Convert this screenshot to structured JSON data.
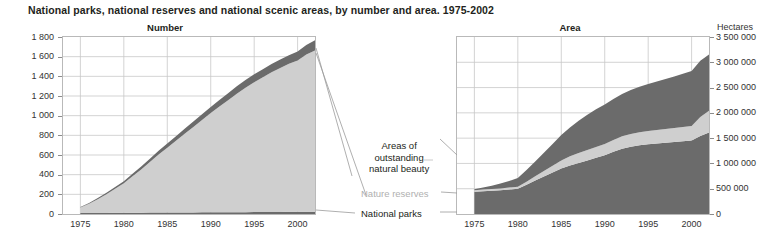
{
  "title": "National parks, national reserves and national scenic areas, by number and area. 1975-2002",
  "colors": {
    "dark_band": "#6b6b6b",
    "light_band": "#cfcfcf",
    "grid": "#c8c8c8",
    "frame": "#b9b9b9",
    "text": "#231f20",
    "muted_text": "#b0b0b0"
  },
  "annotations": {
    "outstanding": "Areas of\noutstanding\nnatural beauty",
    "nature_reserves": "Nature reserves",
    "national_parks": "National parks"
  },
  "chart_data": [
    {
      "type": "area",
      "id": "number",
      "title": "Number",
      "stacked": true,
      "xlabel": "",
      "ylabel": "",
      "unit": "",
      "xlim": [
        1973,
        2002
      ],
      "ylim": [
        0,
        1800
      ],
      "grid": true,
      "legend_position": "callout-right",
      "x": [
        1975,
        1976,
        1977,
        1978,
        1979,
        1980,
        1981,
        1982,
        1983,
        1984,
        1985,
        1986,
        1987,
        1988,
        1989,
        1990,
        1991,
        1992,
        1993,
        1994,
        1995,
        1996,
        1997,
        1998,
        1999,
        2000,
        2001,
        2002
      ],
      "xticks": [
        1975,
        1980,
        1985,
        1990,
        1995,
        2000
      ],
      "yticks": [
        0,
        200,
        400,
        600,
        800,
        1000,
        1200,
        1400,
        1600,
        1800
      ],
      "ytick_labels": [
        "0",
        "200",
        "400",
        "600",
        "800",
        "1 000",
        "1 200",
        "1 400",
        "1 600",
        "1 800"
      ],
      "series": [
        {
          "name": "National parks",
          "color": "#6b6b6b",
          "values": [
            10,
            10,
            11,
            11,
            12,
            12,
            13,
            13,
            14,
            14,
            15,
            15,
            16,
            16,
            17,
            17,
            18,
            18,
            19,
            19,
            20,
            20,
            21,
            21,
            22,
            22,
            23,
            23
          ]
        },
        {
          "name": "Nature reserves",
          "color": "#cfcfcf",
          "values": [
            55,
            95,
            140,
            190,
            245,
            300,
            370,
            440,
            515,
            590,
            660,
            730,
            800,
            870,
            940,
            1010,
            1075,
            1140,
            1205,
            1265,
            1320,
            1370,
            1420,
            1465,
            1505,
            1540,
            1600,
            1640
          ]
        },
        {
          "name": "Areas of outstanding natural beauty",
          "color": "#6b6b6b",
          "values": [
            5,
            8,
            11,
            14,
            18,
            22,
            26,
            30,
            34,
            38,
            42,
            46,
            50,
            54,
            58,
            62,
            66,
            70,
            74,
            78,
            80,
            82,
            84,
            86,
            88,
            90,
            95,
            105
          ]
        }
      ]
    },
    {
      "type": "area",
      "id": "area",
      "title": "Area",
      "stacked": true,
      "xlabel": "",
      "ylabel": "",
      "unit": "Hectares",
      "xlim": [
        1973,
        2002
      ],
      "ylim": [
        0,
        3500000
      ],
      "grid": true,
      "legend_position": "callout-left",
      "x": [
        1975,
        1976,
        1977,
        1978,
        1979,
        1980,
        1981,
        1982,
        1983,
        1984,
        1985,
        1986,
        1987,
        1988,
        1989,
        1990,
        1991,
        1992,
        1993,
        1994,
        1995,
        1996,
        1997,
        1998,
        1999,
        2000,
        2001,
        2002
      ],
      "xticks": [
        1975,
        1980,
        1985,
        1990,
        1995,
        2000
      ],
      "yticks": [
        0,
        500000,
        1000000,
        1500000,
        2000000,
        2500000,
        3000000,
        3500000
      ],
      "ytick_labels": [
        "0",
        "500 000",
        "1 000 000",
        "1 500 000",
        "2 000 000",
        "2 500 000",
        "3 000 000",
        "3 500 000"
      ],
      "series": [
        {
          "name": "National parks",
          "color": "#6b6b6b",
          "values": [
            440000,
            450000,
            460000,
            470000,
            485000,
            500000,
            580000,
            660000,
            740000,
            820000,
            900000,
            960000,
            1010000,
            1060000,
            1110000,
            1160000,
            1230000,
            1290000,
            1330000,
            1360000,
            1380000,
            1395000,
            1410000,
            1425000,
            1440000,
            1455000,
            1540000,
            1610000
          ]
        },
        {
          "name": "Nature reserves",
          "color": "#cfcfcf",
          "values": [
            30000,
            32000,
            34000,
            36000,
            38000,
            40000,
            60000,
            85000,
            110000,
            135000,
            160000,
            180000,
            195000,
            205000,
            215000,
            225000,
            235000,
            245000,
            250000,
            255000,
            260000,
            265000,
            270000,
            275000,
            280000,
            285000,
            380000,
            430000
          ]
        },
        {
          "name": "Areas of outstanding natural beauty",
          "color": "#6b6b6b",
          "values": [
            20000,
            40000,
            65000,
            95000,
            130000,
            170000,
            230000,
            295000,
            360000,
            430000,
            500000,
            570000,
            640000,
            700000,
            745000,
            780000,
            810000,
            840000,
            870000,
            900000,
            930000,
            960000,
            990000,
            1020000,
            1055000,
            1090000,
            1110000,
            1115000
          ]
        }
      ]
    }
  ]
}
